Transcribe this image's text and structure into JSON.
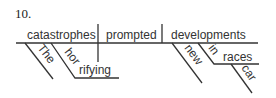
{
  "item_number": "10.",
  "diagram": {
    "type": "sentence-diagram",
    "subject": "catastrophes",
    "verb": "prompted",
    "direct_object": "developments",
    "subject_modifiers": [
      "The",
      "horrifying"
    ],
    "object_modifiers": {
      "adjective": "new",
      "preposition": "in",
      "prepositional_object": "races",
      "prepositional_object_modifier": "car"
    }
  },
  "colors": {
    "ink": "#333333",
    "background": "#ffffff"
  }
}
